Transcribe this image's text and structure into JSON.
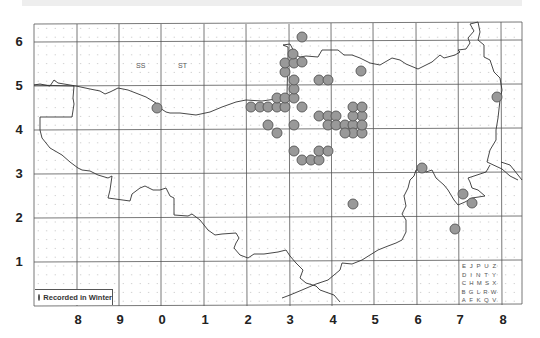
{
  "map": {
    "title": "Distribution map",
    "grid_square_labels": [
      "SS",
      "ST"
    ],
    "y_axis_labels": [
      "6",
      "5",
      "4",
      "3",
      "2",
      "1"
    ],
    "x_axis_labels": [
      "8",
      "9",
      "0",
      "1",
      "2",
      "3",
      "4",
      "5",
      "6",
      "7",
      "8"
    ],
    "legend": {
      "label": "Recorded in Winter",
      "marker_color": "#999999"
    },
    "tetrad_key": {
      "rows": [
        [
          "E",
          "J",
          "P",
          "U",
          "Z"
        ],
        [
          "D",
          "I",
          "N",
          "T",
          "Y"
        ],
        [
          "C",
          "H",
          "M",
          "S",
          "X"
        ],
        [
          "B",
          "G",
          "L",
          "R",
          "W"
        ],
        [
          "A",
          "F",
          "K",
          "Q",
          "V"
        ]
      ]
    },
    "colors": {
      "dot_fill": "#999999",
      "dot_stroke": "#555555",
      "grid": "#444444",
      "boundary": "#333333"
    },
    "record_count": 51
  }
}
